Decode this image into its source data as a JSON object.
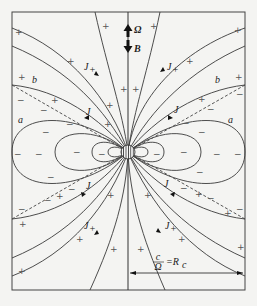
{
  "diagram": {
    "axis_labels": {
      "omega": "Ω",
      "b_field": "B"
    },
    "current_labels": {
      "j_plus": "J",
      "j_plus_sub": "+",
      "j_minus": "J",
      "j_minus_sub": "−"
    },
    "region_labels": {
      "a": "a",
      "b": "b"
    },
    "light_cylinder": {
      "numerator": "c",
      "denominator": "Ω",
      "equals": "=R",
      "subscript": "c"
    },
    "signs": {
      "plus": "+",
      "minus": "−"
    },
    "colors": {
      "line": "#3a3a3a",
      "background": "#f4f4f2"
    }
  }
}
